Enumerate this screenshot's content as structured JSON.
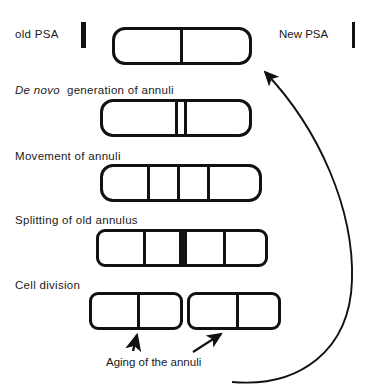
{
  "diagram": {
    "legend": {
      "old_psa_label": "old  PSA",
      "new_psa_label": "New  PSA",
      "old_psa_marker": "thick-vertical-bar",
      "new_psa_marker": "thin-vertical-bar"
    },
    "stages": [
      {
        "id": "old-psa",
        "label": "old  PSA",
        "compartments": 2,
        "divider_count": 1,
        "shape": "rod-rounded-ends"
      },
      {
        "id": "de-novo-generation",
        "label_italic": "De novo",
        "label_rest": "generation  of  annuli",
        "label_full": "De novo  generation  of  annuli",
        "compartments": 3,
        "divider_count": 2,
        "shape": "rod-rounded-ends"
      },
      {
        "id": "movement-of-annuli",
        "label": "Movement  of  annuli",
        "compartments": 4,
        "divider_count": 3,
        "shape": "rod-rounded-ends"
      },
      {
        "id": "splitting-of-old-annulus",
        "label": "Splitting  of  old  annulus",
        "compartments": 4,
        "divider_count": 3,
        "has_thick_center_bar": true,
        "shape": "rod-soft-corners"
      },
      {
        "id": "cell-division",
        "label": "Cell    division",
        "compartments": 4,
        "divider_count": 2,
        "daughter_cells": 2,
        "shape": "two-separated-rods"
      }
    ],
    "annotations": {
      "aging_caption": "Aging  of  the  annuli",
      "aging_arrow_count": 2,
      "feedback_arrow": "curved-loop-right-to-top-cell"
    },
    "colors": {
      "ink": "#111111",
      "background": "#ffffff"
    }
  }
}
